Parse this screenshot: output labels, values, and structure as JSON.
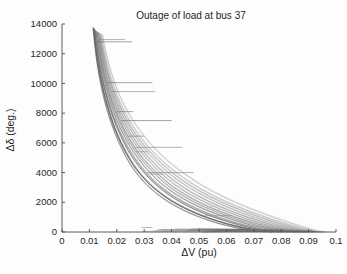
{
  "chart_data": {
    "type": "line",
    "title": "Outage of load at bus 37",
    "xlabel": "ΔV (pu)",
    "ylabel": "Δδ (deg.)",
    "xlim": [
      0,
      0.1
    ],
    "ylim": [
      0,
      14000
    ],
    "xticks": [
      0,
      0.01,
      0.02,
      0.03,
      0.04,
      0.05,
      0.06,
      0.07,
      0.08,
      0.09,
      0.1
    ],
    "xtick_labels": [
      "0",
      "0.01",
      "0.02",
      "0.03",
      "0.04",
      "0.05",
      "0.06",
      "0.07",
      "0.08",
      "0.09",
      "0.1"
    ],
    "yticks": [
      0,
      2000,
      4000,
      6000,
      8000,
      10000,
      12000,
      14000
    ],
    "ytick_labels": [
      "0",
      "2000",
      "4000",
      "6000",
      "8000",
      "10000",
      "12000",
      "14000"
    ],
    "grid": false,
    "legend": null,
    "series_count": 14,
    "series": [
      {
        "name": "curve-1",
        "color": "#3c3c3c",
        "points": [
          [
            0.0116,
            13700
          ],
          [
            0.0122,
            12600
          ],
          [
            0.0131,
            11400
          ],
          [
            0.0143,
            10200
          ],
          [
            0.0158,
            9000
          ],
          [
            0.0177,
            7800
          ],
          [
            0.0201,
            6600
          ],
          [
            0.0232,
            5400
          ],
          [
            0.0273,
            4200
          ],
          [
            0.0327,
            3100
          ],
          [
            0.0399,
            2100
          ],
          [
            0.049,
            1250
          ],
          [
            0.0588,
            620
          ],
          [
            0.0672,
            250
          ],
          [
            0.0731,
            70
          ],
          [
            0.0765,
            10
          ]
        ]
      },
      {
        "name": "curve-2",
        "color": "#4a4a4a",
        "points": [
          [
            0.0119,
            13600
          ],
          [
            0.0126,
            12500
          ],
          [
            0.0136,
            11300
          ],
          [
            0.0149,
            10100
          ],
          [
            0.0165,
            8900
          ],
          [
            0.0186,
            7700
          ],
          [
            0.0213,
            6500
          ],
          [
            0.0247,
            5300
          ],
          [
            0.0292,
            4150
          ],
          [
            0.0351,
            3050
          ],
          [
            0.0428,
            2050
          ],
          [
            0.0524,
            1200
          ],
          [
            0.0623,
            590
          ],
          [
            0.0704,
            230
          ],
          [
            0.0757,
            60
          ],
          [
            0.0788,
            8
          ]
        ]
      },
      {
        "name": "curve-3",
        "color": "#565656",
        "points": [
          [
            0.0113,
            13750
          ],
          [
            0.0119,
            12650
          ],
          [
            0.0127,
            11450
          ],
          [
            0.0138,
            10250
          ],
          [
            0.0152,
            9050
          ],
          [
            0.017,
            7850
          ],
          [
            0.0193,
            6650
          ],
          [
            0.0222,
            5450
          ],
          [
            0.026,
            4250
          ],
          [
            0.031,
            3150
          ],
          [
            0.0377,
            2150
          ],
          [
            0.0462,
            1300
          ],
          [
            0.0556,
            650
          ],
          [
            0.064,
            270
          ],
          [
            0.0702,
            80
          ],
          [
            0.074,
            12
          ]
        ]
      },
      {
        "name": "curve-4",
        "color": "#646464",
        "points": [
          [
            0.0124,
            13500
          ],
          [
            0.0132,
            12400
          ],
          [
            0.0143,
            11200
          ],
          [
            0.0157,
            10000
          ],
          [
            0.0175,
            8800
          ],
          [
            0.0198,
            7600
          ],
          [
            0.0228,
            6400
          ],
          [
            0.0266,
            5250
          ],
          [
            0.0315,
            4100
          ],
          [
            0.0379,
            3000
          ],
          [
            0.0463,
            2020
          ],
          [
            0.0566,
            1180
          ],
          [
            0.0668,
            570
          ],
          [
            0.0748,
            215
          ],
          [
            0.0798,
            55
          ],
          [
            0.0826,
            6
          ]
        ]
      },
      {
        "name": "curve-5",
        "color": "#717171",
        "points": [
          [
            0.0128,
            13450
          ],
          [
            0.0137,
            12350
          ],
          [
            0.0149,
            11150
          ],
          [
            0.0164,
            9950
          ],
          [
            0.0184,
            8750
          ],
          [
            0.021,
            7550
          ],
          [
            0.0243,
            6350
          ],
          [
            0.0285,
            5200
          ],
          [
            0.034,
            4070
          ],
          [
            0.041,
            2980
          ],
          [
            0.05,
            2000
          ],
          [
            0.0608,
            1160
          ],
          [
            0.0712,
            550
          ],
          [
            0.0792,
            200
          ],
          [
            0.084,
            48
          ],
          [
            0.0866,
            5
          ]
        ]
      },
      {
        "name": "curve-6",
        "color": "#7e7e7e",
        "points": [
          [
            0.0133,
            13400
          ],
          [
            0.0143,
            12300
          ],
          [
            0.0156,
            11100
          ],
          [
            0.0173,
            9900
          ],
          [
            0.0195,
            8700
          ],
          [
            0.0224,
            7500
          ],
          [
            0.0261,
            6320
          ],
          [
            0.0308,
            5170
          ],
          [
            0.0369,
            4040
          ],
          [
            0.0446,
            2960
          ],
          [
            0.0543,
            1980
          ],
          [
            0.0655,
            1140
          ],
          [
            0.0758,
            530
          ],
          [
            0.0834,
            185
          ],
          [
            0.0878,
            42
          ],
          [
            0.09,
            4
          ]
        ]
      },
      {
        "name": "curve-7",
        "color": "#8b8b8b",
        "points": [
          [
            0.0138,
            13350
          ],
          [
            0.0149,
            12250
          ],
          [
            0.0163,
            11050
          ],
          [
            0.0182,
            9850
          ],
          [
            0.0207,
            8650
          ],
          [
            0.0239,
            7460
          ],
          [
            0.028,
            6290
          ],
          [
            0.0333,
            5140
          ],
          [
            0.04,
            4015
          ],
          [
            0.0484,
            2940
          ],
          [
            0.0587,
            1965
          ],
          [
            0.0702,
            1125
          ],
          [
            0.0803,
            515
          ],
          [
            0.0874,
            172
          ],
          [
            0.0913,
            38
          ],
          [
            0.0932,
            3
          ]
        ]
      },
      {
        "name": "curve-8",
        "color": "#5f5f5f",
        "points": [
          [
            0.0115,
            13680
          ],
          [
            0.0121,
            12580
          ],
          [
            0.013,
            11380
          ],
          [
            0.0142,
            10180
          ],
          [
            0.0157,
            8980
          ],
          [
            0.0176,
            7780
          ],
          [
            0.02,
            6580
          ],
          [
            0.0231,
            5390
          ],
          [
            0.0272,
            4190
          ],
          [
            0.0326,
            3090
          ],
          [
            0.0398,
            2095
          ],
          [
            0.0489,
            1245
          ],
          [
            0.0586,
            615
          ],
          [
            0.067,
            248
          ],
          [
            0.0729,
            68
          ],
          [
            0.0763,
            9
          ]
        ]
      },
      {
        "name": "curve-9",
        "color": "#6b6b6b",
        "points": [
          [
            0.0121,
            13580
          ],
          [
            0.0128,
            12480
          ],
          [
            0.0138,
            11280
          ],
          [
            0.0151,
            10080
          ],
          [
            0.0168,
            8880
          ],
          [
            0.019,
            7680
          ],
          [
            0.0218,
            6480
          ],
          [
            0.0254,
            5290
          ],
          [
            0.03,
            4130
          ],
          [
            0.0361,
            3030
          ],
          [
            0.0441,
            2040
          ],
          [
            0.054,
            1195
          ],
          [
            0.0641,
            585
          ],
          [
            0.0722,
            225
          ],
          [
            0.0773,
            58
          ],
          [
            0.0803,
            7
          ]
        ]
      },
      {
        "name": "curve-10",
        "color": "#787878",
        "points": [
          [
            0.0126,
            13480
          ],
          [
            0.0135,
            12380
          ],
          [
            0.0146,
            11180
          ],
          [
            0.0161,
            9980
          ],
          [
            0.018,
            8780
          ],
          [
            0.0205,
            7580
          ],
          [
            0.0236,
            6380
          ],
          [
            0.0276,
            5230
          ],
          [
            0.0328,
            4090
          ],
          [
            0.0395,
            2990
          ],
          [
            0.0482,
            2010
          ],
          [
            0.0588,
            1170
          ],
          [
            0.069,
            560
          ],
          [
            0.077,
            208
          ],
          [
            0.0819,
            50
          ],
          [
            0.0846,
            5
          ]
        ]
      },
      {
        "name": "curve-11",
        "color": "#858585",
        "points": [
          [
            0.0131,
            13420
          ],
          [
            0.0141,
            12320
          ],
          [
            0.0153,
            11120
          ],
          [
            0.0169,
            9920
          ],
          [
            0.019,
            8720
          ],
          [
            0.0217,
            7520
          ],
          [
            0.0252,
            6340
          ],
          [
            0.0297,
            5185
          ],
          [
            0.0355,
            4055
          ],
          [
            0.0428,
            2970
          ],
          [
            0.0522,
            1990
          ],
          [
            0.0632,
            1150
          ],
          [
            0.0735,
            540
          ],
          [
            0.0813,
            192
          ],
          [
            0.0859,
            45
          ],
          [
            0.0883,
            4
          ]
        ]
      },
      {
        "name": "curve-12",
        "color": "#929292",
        "points": [
          [
            0.0136,
            13370
          ],
          [
            0.0146,
            12270
          ],
          [
            0.016,
            11070
          ],
          [
            0.0178,
            9870
          ],
          [
            0.0201,
            8670
          ],
          [
            0.0232,
            7480
          ],
          [
            0.0271,
            6300
          ],
          [
            0.0321,
            5155
          ],
          [
            0.0385,
            4025
          ],
          [
            0.0466,
            2950
          ],
          [
            0.0566,
            1972
          ],
          [
            0.0679,
            1132
          ],
          [
            0.0781,
            522
          ],
          [
            0.0855,
            178
          ],
          [
            0.0897,
            40
          ],
          [
            0.0918,
            3
          ]
        ]
      },
      {
        "name": "curve-13",
        "color": "#9f9f9f",
        "points": [
          [
            0.0142,
            13320
          ],
          [
            0.0153,
            12220
          ],
          [
            0.0168,
            11020
          ],
          [
            0.0188,
            9820
          ],
          [
            0.0214,
            8620
          ],
          [
            0.0248,
            7440
          ],
          [
            0.0291,
            6270
          ],
          [
            0.0346,
            5125
          ],
          [
            0.0416,
            4005
          ],
          [
            0.0503,
            2930
          ],
          [
            0.0608,
            1955
          ],
          [
            0.0724,
            1118
          ],
          [
            0.0824,
            508
          ],
          [
            0.0892,
            166
          ],
          [
            0.0928,
            35
          ],
          [
            0.0946,
            3
          ]
        ]
      },
      {
        "name": "curve-14",
        "color": "#aaaaaa",
        "points": [
          [
            0.0147,
            13280
          ],
          [
            0.0159,
            12180
          ],
          [
            0.0175,
            10980
          ],
          [
            0.0197,
            9780
          ],
          [
            0.0225,
            8580
          ],
          [
            0.0262,
            7410
          ],
          [
            0.0308,
            6245
          ],
          [
            0.0366,
            5105
          ],
          [
            0.044,
            3990
          ],
          [
            0.0531,
            2915
          ],
          [
            0.0638,
            1942
          ],
          [
            0.0754,
            1106
          ],
          [
            0.085,
            498
          ],
          [
            0.0913,
            158
          ],
          [
            0.0945,
            32
          ],
          [
            0.096,
            2
          ]
        ]
      }
    ],
    "spikes": [
      {
        "y": 12800,
        "x_start": 0.013,
        "x_end": 0.0256,
        "color": "#6a6a6a"
      },
      {
        "y": 12950,
        "x_start": 0.0135,
        "x_end": 0.023,
        "color": "#7c7c7c"
      },
      {
        "y": 10050,
        "x_start": 0.0165,
        "x_end": 0.033,
        "color": "#6a6a6a"
      },
      {
        "y": 9450,
        "x_start": 0.018,
        "x_end": 0.034,
        "color": "#7c7c7c"
      },
      {
        "y": 8100,
        "x_start": 0.02,
        "x_end": 0.026,
        "color": "#6a6a6a"
      },
      {
        "y": 7500,
        "x_start": 0.0215,
        "x_end": 0.04,
        "color": "#6a6a6a"
      },
      {
        "y": 6450,
        "x_start": 0.024,
        "x_end": 0.03,
        "color": "#7c7c7c"
      },
      {
        "y": 5700,
        "x_start": 0.0265,
        "x_end": 0.044,
        "color": "#7c7c7c"
      },
      {
        "y": 5400,
        "x_start": 0.027,
        "x_end": 0.0315,
        "color": "#8a8a8a"
      },
      {
        "y": 4000,
        "x_start": 0.031,
        "x_end": 0.048,
        "color": "#7c7c7c"
      },
      {
        "y": 3900,
        "x_start": 0.0318,
        "x_end": 0.037,
        "color": "#8a8a8a"
      },
      {
        "y": 1100,
        "x_start": 0.052,
        "x_end": 0.062,
        "color": "#8a8a8a"
      },
      {
        "y": 300,
        "x_start": 0.029,
        "x_end": 0.033,
        "color": "#8a8a8a"
      }
    ],
    "baseline_band": {
      "description": "Dense tangled near-zero trajectory band along Δδ = 0",
      "x_start": 0.028,
      "x_end": 0.096,
      "y_max": 260
    }
  }
}
